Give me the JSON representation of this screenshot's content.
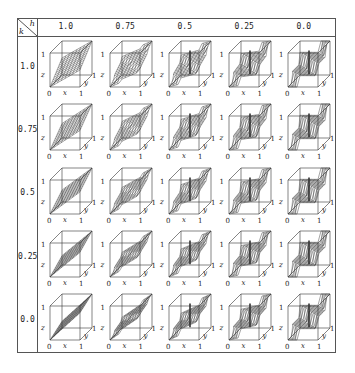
{
  "figure": {
    "corner": {
      "col_var": "h",
      "row_var": "k"
    },
    "columns": [
      "1.0",
      "0.75",
      "0.5",
      "0.25",
      "0.0"
    ],
    "rows": [
      "1.0",
      "0.75",
      "0.5",
      "0.25",
      "0.0"
    ],
    "axis_labels": {
      "x_origin": "0",
      "x_max": "1",
      "x_name": "x",
      "z_max": "1",
      "z_name": "z",
      "y_max": "1",
      "y_name": "y"
    },
    "colors": {
      "line": "#333333",
      "border": "#555555",
      "background": "#ffffff"
    }
  }
}
